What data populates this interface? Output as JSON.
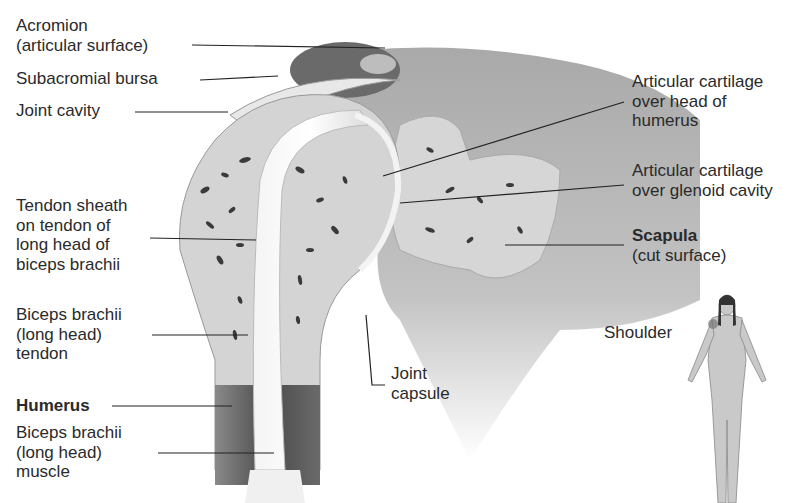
{
  "diagram": {
    "labels": {
      "acromion": [
        "Acromion",
        "(articular surface)"
      ],
      "subacromial_bursa": [
        "Subacromial bursa"
      ],
      "joint_cavity": [
        "Joint cavity"
      ],
      "tendon_sheath": [
        "Tendon sheath",
        "on tendon of",
        "long head of",
        "biceps brachii"
      ],
      "biceps_tendon": [
        "Biceps brachii",
        "(long head)",
        "tendon"
      ],
      "humerus": [
        "Humerus"
      ],
      "biceps_muscle": [
        "Biceps brachii",
        "(long head)",
        "muscle"
      ],
      "cartilage_humerus": [
        "Articular cartilage",
        "over head of",
        "humerus"
      ],
      "cartilage_glenoid": [
        "Articular cartilage",
        "over glenoid cavity"
      ],
      "scapula": [
        "Scapula",
        "(cut surface)"
      ],
      "joint_capsule": [
        "Joint",
        "capsule"
      ],
      "shoulder": [
        "Shoulder"
      ]
    },
    "colors": {
      "bone": "#d8d8d8",
      "spongy_pores": "#3a3a3a",
      "cartilage": "#eeeeee",
      "scapula_shade": "#8a8a8a",
      "muscle": "#555555",
      "label_text": "#2a2a2a"
    }
  }
}
